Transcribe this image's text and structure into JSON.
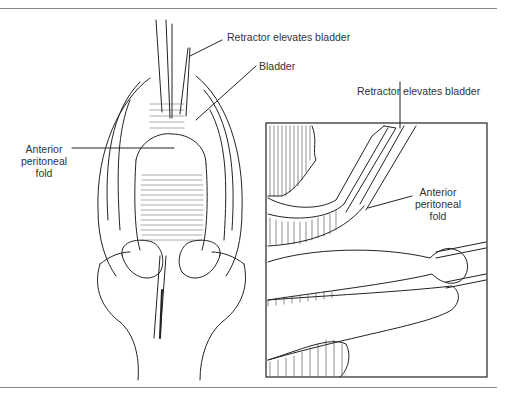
{
  "figure": {
    "main_view": {
      "labels": {
        "retractor": "Retractor elevates bladder",
        "bladder": "Bladder",
        "fold_line1": "Anterior",
        "fold_line2": "peritoneal",
        "fold_line3": "fold"
      }
    },
    "inset_view": {
      "labels": {
        "retractor": "Retractor elevates bladder",
        "fold_line1": "Anterior",
        "fold_line2": "peritoneal",
        "fold_line3": "fold"
      }
    },
    "colors": {
      "line": "#222222",
      "text": "#333333",
      "rule": "#8a8a8a",
      "background": "#ffffff"
    }
  }
}
